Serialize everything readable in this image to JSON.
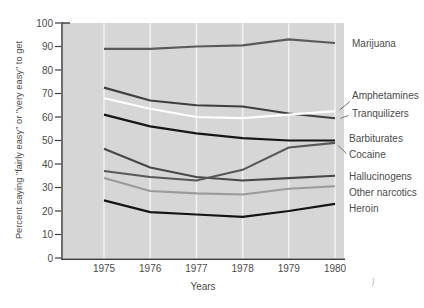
{
  "figure": {
    "background": "#ffffff",
    "plot_background": "#d6d6d6",
    "gridline_color": "#f2f2f2",
    "axis_color": "#3c3c3c",
    "text_color": "#4b4b4b",
    "annotation_arrow_color": "#6a6a6a"
  },
  "chart_data": {
    "type": "line",
    "title": "",
    "xlabel": "Years",
    "ylabel": "Percent saying \"fairly easy\" or \"very easy\" to get",
    "x": [
      1975,
      1976,
      1977,
      1978,
      1979,
      1980
    ],
    "ylim": [
      0,
      100
    ],
    "ytick_step": 10,
    "grid": "vertical white gridlines on gray panel",
    "legend_position": "labels at right end of each line",
    "series": [
      {
        "name": "Marijuana",
        "color": "#5a5a5a",
        "width": 2.2,
        "values": [
          89,
          89,
          90,
          90.5,
          93,
          91.5
        ]
      },
      {
        "name": "Amphetamines",
        "color": "#ffffff",
        "width": 2.2,
        "values": [
          68,
          63.5,
          60,
          59.5,
          61,
          62.5
        ]
      },
      {
        "name": "Tranquilizers",
        "color": "#3f3f3f",
        "width": 2.1,
        "values": [
          72.5,
          67,
          65,
          64.5,
          61.5,
          59.5
        ]
      },
      {
        "name": "Barbiturates",
        "color": "#161616",
        "width": 2.2,
        "values": [
          61,
          56,
          53,
          51,
          50,
          50
        ]
      },
      {
        "name": "Cocaine",
        "color": "#575757",
        "width": 2.1,
        "values": [
          37,
          34.5,
          33,
          37.5,
          47,
          49
        ]
      },
      {
        "name": "Hallucinogens",
        "color": "#474747",
        "width": 2.1,
        "values": [
          46.5,
          38.5,
          34.5,
          33,
          34,
          35
        ]
      },
      {
        "name": "Other narcotics",
        "color": "#9a9a9a",
        "width": 2.1,
        "values": [
          34,
          28.5,
          27.5,
          27,
          29.5,
          30.5
        ]
      },
      {
        "name": "Heroin",
        "color": "#141414",
        "width": 2.2,
        "values": [
          24.5,
          19.5,
          18.5,
          17.5,
          20,
          23
        ]
      }
    ]
  }
}
